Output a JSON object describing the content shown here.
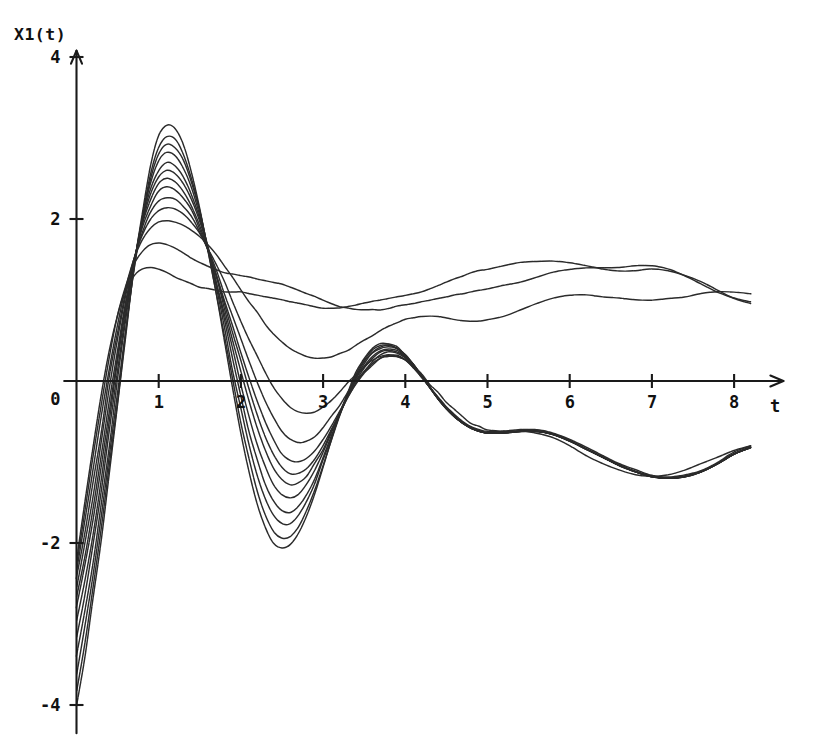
{
  "figure": {
    "background_color": "#ffffff",
    "ink_color": "#2b2b2b",
    "axis_color": "#1a1a1a"
  },
  "chart_data": {
    "type": "line",
    "title": "",
    "subtitle": "",
    "ylabel": "X1(t)",
    "xlabel": "t",
    "xlim": [
      -0.15,
      8.6
    ],
    "ylim": [
      -4.35,
      4.3
    ],
    "grid": false,
    "legend": null,
    "legend_position": "none",
    "x_ticks": [
      1,
      2,
      3,
      4,
      5,
      6,
      7,
      8
    ],
    "x_tick_labels": [
      "1",
      "2",
      "3",
      "4",
      "5",
      "6",
      "7",
      "8"
    ],
    "y_ticks": [
      4,
      2,
      0,
      -2,
      -4
    ],
    "y_tick_labels": [
      "4",
      "2",
      "0",
      "-2",
      "-4"
    ],
    "axis_arrows": [
      "x-positive",
      "y-positive"
    ],
    "annotations": [],
    "series_count": 13,
    "x": [
      0.0,
      0.1,
      0.2,
      0.3,
      0.4,
      0.5,
      0.6,
      0.7,
      0.8,
      0.9,
      1.0,
      1.1,
      1.2,
      1.3,
      1.4,
      1.5,
      1.6,
      1.7,
      1.8,
      1.9,
      2.0,
      2.1,
      2.2,
      2.3,
      2.4,
      2.5,
      2.6,
      2.7,
      2.8,
      2.9,
      3.0,
      3.1,
      3.2,
      3.3,
      3.4,
      3.5,
      3.6,
      3.7,
      3.8,
      3.9,
      4.0,
      4.1,
      4.2,
      4.3,
      4.4,
      4.5,
      4.6,
      4.7,
      4.8,
      4.9,
      5.0,
      5.2,
      5.4,
      5.6,
      5.8,
      6.0,
      6.2,
      6.4,
      6.6,
      6.8,
      7.0,
      7.2,
      7.4,
      7.6,
      7.8,
      8.0,
      8.2
    ],
    "series": [
      {
        "name": "curve-01",
        "initial_value": -4.0,
        "values": [
          -4.0,
          -3.4,
          -2.72,
          -1.96,
          -1.14,
          -0.28,
          0.58,
          1.38,
          2.08,
          2.66,
          3.02,
          3.16,
          3.12,
          2.92,
          2.58,
          2.14,
          1.62,
          1.06,
          0.48,
          -0.1,
          -0.64,
          -1.12,
          -1.52,
          -1.82,
          -2.0,
          -2.06,
          -2.02,
          -1.88,
          -1.66,
          -1.38,
          -1.06,
          -0.74,
          -0.42,
          -0.14,
          0.1,
          0.28,
          0.4,
          0.46,
          0.46,
          0.42,
          0.32,
          0.2,
          0.06,
          -0.08,
          -0.22,
          -0.34,
          -0.44,
          -0.52,
          -0.58,
          -0.62,
          -0.64,
          -0.64,
          -0.62,
          -0.62,
          -0.66,
          -0.74,
          -0.84,
          -0.94,
          -1.04,
          -1.12,
          -1.18,
          -1.2,
          -1.18,
          -1.12,
          -1.02,
          -0.9,
          -0.82
        ]
      },
      {
        "name": "curve-02",
        "initial_value": -3.82,
        "values": [
          -3.82,
          -3.24,
          -2.58,
          -1.84,
          -1.04,
          -0.22,
          0.6,
          1.36,
          2.02,
          2.56,
          2.88,
          3.02,
          2.98,
          2.8,
          2.5,
          2.1,
          1.62,
          1.1,
          0.56,
          0.02,
          -0.5,
          -0.96,
          -1.36,
          -1.66,
          -1.86,
          -1.94,
          -1.92,
          -1.8,
          -1.6,
          -1.34,
          -1.04,
          -0.74,
          -0.44,
          -0.16,
          0.08,
          0.26,
          0.38,
          0.44,
          0.44,
          0.4,
          0.32,
          0.2,
          0.06,
          -0.08,
          -0.22,
          -0.34,
          -0.44,
          -0.52,
          -0.58,
          -0.62,
          -0.64,
          -0.64,
          -0.62,
          -0.62,
          -0.66,
          -0.74,
          -0.84,
          -0.94,
          -1.04,
          -1.12,
          -1.18,
          -1.2,
          -1.18,
          -1.12,
          -1.02,
          -0.9,
          -0.82
        ]
      },
      {
        "name": "curve-03",
        "initial_value": -3.62,
        "values": [
          -3.62,
          -3.06,
          -2.42,
          -1.7,
          -0.92,
          -0.12,
          0.66,
          1.38,
          2.0,
          2.5,
          2.8,
          2.92,
          2.88,
          2.72,
          2.44,
          2.08,
          1.64,
          1.16,
          0.66,
          0.14,
          -0.34,
          -0.78,
          -1.16,
          -1.46,
          -1.66,
          -1.76,
          -1.76,
          -1.66,
          -1.48,
          -1.26,
          -0.98,
          -0.7,
          -0.42,
          -0.16,
          0.06,
          0.24,
          0.36,
          0.42,
          0.44,
          0.4,
          0.32,
          0.2,
          0.06,
          -0.08,
          -0.22,
          -0.34,
          -0.44,
          -0.52,
          -0.58,
          -0.62,
          -0.64,
          -0.64,
          -0.62,
          -0.62,
          -0.66,
          -0.74,
          -0.84,
          -0.94,
          -1.04,
          -1.12,
          -1.18,
          -1.2,
          -1.18,
          -1.12,
          -1.02,
          -0.9,
          -0.82
        ]
      },
      {
        "name": "curve-04",
        "initial_value": -3.4,
        "values": [
          -3.4,
          -2.86,
          -2.24,
          -1.54,
          -0.78,
          0.0,
          0.74,
          1.42,
          2.0,
          2.44,
          2.72,
          2.82,
          2.78,
          2.62,
          2.38,
          2.04,
          1.64,
          1.2,
          0.74,
          0.26,
          -0.2,
          -0.62,
          -0.98,
          -1.28,
          -1.48,
          -1.6,
          -1.62,
          -1.54,
          -1.4,
          -1.2,
          -0.94,
          -0.68,
          -0.42,
          -0.18,
          0.04,
          0.22,
          0.34,
          0.4,
          0.42,
          0.4,
          0.32,
          0.2,
          0.06,
          -0.08,
          -0.22,
          -0.34,
          -0.44,
          -0.52,
          -0.58,
          -0.62,
          -0.64,
          -0.64,
          -0.62,
          -0.62,
          -0.66,
          -0.74,
          -0.84,
          -0.94,
          -1.04,
          -1.12,
          -1.18,
          -1.2,
          -1.18,
          -1.12,
          -1.02,
          -0.9,
          -0.82
        ]
      },
      {
        "name": "curve-05",
        "initial_value": -3.16,
        "values": [
          -3.16,
          -2.64,
          -2.04,
          -1.36,
          -0.62,
          0.12,
          0.82,
          1.44,
          1.96,
          2.36,
          2.6,
          2.7,
          2.66,
          2.52,
          2.3,
          2.0,
          1.64,
          1.24,
          0.82,
          0.38,
          -0.04,
          -0.44,
          -0.78,
          -1.06,
          -1.28,
          -1.4,
          -1.44,
          -1.4,
          -1.28,
          -1.1,
          -0.88,
          -0.64,
          -0.4,
          -0.18,
          0.02,
          0.18,
          0.3,
          0.38,
          0.4,
          0.38,
          0.3,
          0.2,
          0.06,
          -0.08,
          -0.22,
          -0.34,
          -0.44,
          -0.52,
          -0.58,
          -0.62,
          -0.64,
          -0.64,
          -0.62,
          -0.62,
          -0.66,
          -0.74,
          -0.84,
          -0.94,
          -1.04,
          -1.12,
          -1.18,
          -1.2,
          -1.18,
          -1.12,
          -1.02,
          -0.9,
          -0.82
        ]
      },
      {
        "name": "curve-06",
        "initial_value": -2.96,
        "values": [
          -2.96,
          -2.46,
          -1.88,
          -1.22,
          -0.5,
          0.22,
          0.88,
          1.46,
          1.94,
          2.3,
          2.52,
          2.6,
          2.56,
          2.44,
          2.24,
          1.96,
          1.64,
          1.28,
          0.9,
          0.5,
          0.12,
          -0.26,
          -0.58,
          -0.86,
          -1.08,
          -1.22,
          -1.28,
          -1.26,
          -1.18,
          -1.02,
          -0.84,
          -0.62,
          -0.4,
          -0.18,
          0.0,
          0.16,
          0.28,
          0.36,
          0.38,
          0.36,
          0.3,
          0.2,
          0.06,
          -0.08,
          -0.22,
          -0.34,
          -0.44,
          -0.52,
          -0.58,
          -0.62,
          -0.64,
          -0.64,
          -0.62,
          -0.62,
          -0.66,
          -0.74,
          -0.84,
          -0.94,
          -1.04,
          -1.12,
          -1.18,
          -1.2,
          -1.18,
          -1.12,
          -1.02,
          -0.9,
          -0.82
        ]
      },
      {
        "name": "curve-07",
        "initial_value": -2.8,
        "values": [
          -2.8,
          -2.3,
          -1.72,
          -1.06,
          -0.36,
          0.32,
          0.94,
          1.48,
          1.92,
          2.24,
          2.44,
          2.5,
          2.46,
          2.34,
          2.16,
          1.92,
          1.62,
          1.3,
          0.96,
          0.6,
          0.24,
          -0.1,
          -0.42,
          -0.7,
          -0.92,
          -1.06,
          -1.14,
          -1.14,
          -1.08,
          -0.96,
          -0.8,
          -0.6,
          -0.4,
          -0.2,
          -0.02,
          0.12,
          0.24,
          0.32,
          0.36,
          0.34,
          0.28,
          0.18,
          0.06,
          -0.08,
          -0.22,
          -0.34,
          -0.44,
          -0.52,
          -0.58,
          -0.62,
          -0.64,
          -0.64,
          -0.62,
          -0.62,
          -0.66,
          -0.74,
          -0.84,
          -0.94,
          -1.04,
          -1.12,
          -1.18,
          -1.2,
          -1.18,
          -1.12,
          -1.02,
          -0.9,
          -0.82
        ]
      },
      {
        "name": "curve-08",
        "initial_value": -2.66,
        "values": [
          -2.66,
          -2.16,
          -1.58,
          -0.92,
          -0.24,
          0.4,
          0.98,
          1.48,
          1.88,
          2.16,
          2.34,
          2.4,
          2.36,
          2.26,
          2.1,
          1.88,
          1.62,
          1.32,
          1.0,
          0.68,
          0.36,
          0.04,
          -0.26,
          -0.52,
          -0.74,
          -0.9,
          -0.98,
          -1.0,
          -0.96,
          -0.86,
          -0.72,
          -0.56,
          -0.38,
          -0.2,
          -0.04,
          0.1,
          0.2,
          0.28,
          0.32,
          0.32,
          0.26,
          0.16,
          0.04,
          -0.08,
          -0.22,
          -0.34,
          -0.44,
          -0.52,
          -0.58,
          -0.62,
          -0.64,
          -0.64,
          -0.62,
          -0.62,
          -0.66,
          -0.74,
          -0.84,
          -0.94,
          -1.04,
          -1.12,
          -1.18,
          -1.2,
          -1.18,
          -1.12,
          -1.02,
          -0.9,
          -0.82
        ]
      },
      {
        "name": "curve-09",
        "initial_value": -2.54,
        "values": [
          -2.54,
          -2.02,
          -1.42,
          -0.76,
          -0.08,
          0.52,
          1.06,
          1.5,
          1.84,
          2.08,
          2.22,
          2.26,
          2.24,
          2.16,
          2.02,
          1.84,
          1.62,
          1.36,
          1.08,
          0.8,
          0.52,
          0.24,
          -0.02,
          -0.26,
          -0.46,
          -0.62,
          -0.72,
          -0.76,
          -0.74,
          -0.68,
          -0.58,
          -0.44,
          -0.3,
          -0.14,
          0.0,
          0.12,
          0.22,
          0.28,
          0.3,
          0.3,
          0.26,
          0.16,
          0.04,
          -0.08,
          -0.2,
          -0.32,
          -0.42,
          -0.5,
          -0.56,
          -0.6,
          -0.62,
          -0.62,
          -0.6,
          -0.6,
          -0.64,
          -0.72,
          -0.82,
          -0.92,
          -1.02,
          -1.1,
          -1.16,
          -1.18,
          -1.16,
          -1.1,
          -1.0,
          -0.88,
          -0.8
        ]
      },
      {
        "name": "curve-10",
        "initial_value": -2.44,
        "values": [
          -2.44,
          -1.9,
          -1.28,
          -0.62,
          0.04,
          0.62,
          1.12,
          1.52,
          1.8,
          2.0,
          2.1,
          2.14,
          2.12,
          2.06,
          1.96,
          1.82,
          1.64,
          1.44,
          1.22,
          0.98,
          0.74,
          0.52,
          0.3,
          0.1,
          -0.08,
          -0.22,
          -0.32,
          -0.38,
          -0.4,
          -0.38,
          -0.32,
          -0.24,
          -0.14,
          -0.02,
          0.08,
          0.18,
          0.26,
          0.3,
          0.32,
          0.3,
          0.26,
          0.18,
          0.08,
          -0.04,
          -0.14,
          -0.26,
          -0.36,
          -0.44,
          -0.52,
          -0.56,
          -0.6,
          -0.62,
          -0.62,
          -0.64,
          -0.7,
          -0.8,
          -0.92,
          -1.02,
          -1.1,
          -1.16,
          -1.18,
          -1.16,
          -1.1,
          -1.02,
          -0.94,
          -0.86,
          -0.8
        ]
      },
      {
        "name": "curve-11",
        "initial_value": -2.34,
        "values": [
          -2.34,
          -1.76,
          -1.12,
          -0.46,
          0.16,
          0.72,
          1.16,
          1.5,
          1.74,
          1.88,
          1.96,
          1.98,
          1.96,
          1.92,
          1.86,
          1.78,
          1.68,
          1.56,
          1.42,
          1.28,
          1.12,
          0.98,
          0.84,
          0.7,
          0.58,
          0.48,
          0.4,
          0.34,
          0.3,
          0.28,
          0.28,
          0.3,
          0.34,
          0.38,
          0.44,
          0.5,
          0.56,
          0.62,
          0.68,
          0.72,
          0.76,
          0.78,
          0.8,
          0.8,
          0.8,
          0.78,
          0.76,
          0.74,
          0.74,
          0.74,
          0.76,
          0.8,
          0.88,
          0.96,
          1.02,
          1.06,
          1.06,
          1.04,
          1.02,
          1.0,
          1.0,
          1.02,
          1.04,
          1.08,
          1.1,
          1.1,
          1.08
        ]
      },
      {
        "name": "curve-12",
        "initial_value": -2.26,
        "values": [
          -2.26,
          -1.62,
          -0.94,
          -0.28,
          0.3,
          0.8,
          1.18,
          1.44,
          1.6,
          1.68,
          1.7,
          1.68,
          1.64,
          1.58,
          1.52,
          1.46,
          1.42,
          1.38,
          1.34,
          1.32,
          1.3,
          1.28,
          1.26,
          1.24,
          1.22,
          1.2,
          1.16,
          1.12,
          1.08,
          1.04,
          1.0,
          0.96,
          0.92,
          0.9,
          0.88,
          0.88,
          0.88,
          0.88,
          0.9,
          0.92,
          0.94,
          0.96,
          0.98,
          1.0,
          1.02,
          1.04,
          1.06,
          1.08,
          1.1,
          1.12,
          1.14,
          1.18,
          1.22,
          1.28,
          1.34,
          1.38,
          1.4,
          1.4,
          1.4,
          1.42,
          1.42,
          1.38,
          1.3,
          1.2,
          1.1,
          1.02,
          0.98
        ]
      },
      {
        "name": "curve-13",
        "initial_value": -2.2,
        "values": [
          -2.2,
          -1.5,
          -0.8,
          -0.16,
          0.38,
          0.82,
          1.12,
          1.3,
          1.38,
          1.4,
          1.38,
          1.34,
          1.28,
          1.24,
          1.2,
          1.16,
          1.14,
          1.12,
          1.1,
          1.1,
          1.1,
          1.08,
          1.06,
          1.04,
          1.02,
          1.0,
          0.98,
          0.96,
          0.94,
          0.92,
          0.9,
          0.9,
          0.9,
          0.92,
          0.94,
          0.96,
          0.98,
          1.0,
          1.02,
          1.04,
          1.06,
          1.08,
          1.1,
          1.14,
          1.18,
          1.22,
          1.26,
          1.3,
          1.34,
          1.36,
          1.38,
          1.42,
          1.46,
          1.48,
          1.48,
          1.46,
          1.42,
          1.38,
          1.36,
          1.36,
          1.38,
          1.36,
          1.3,
          1.22,
          1.12,
          1.02,
          0.96
        ]
      }
    ]
  }
}
